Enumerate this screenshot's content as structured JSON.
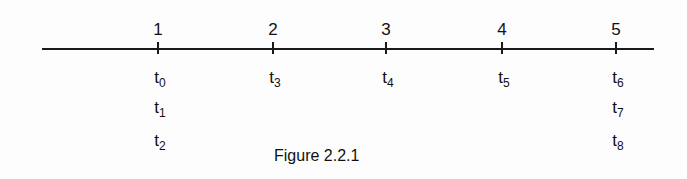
{
  "diagram": {
    "caption": "Figure  2.2.1",
    "points": [
      {
        "label": "1",
        "x": 158,
        "times": [
          "0",
          "1",
          "2"
        ]
      },
      {
        "label": "2",
        "x": 273,
        "times": [
          "3"
        ]
      },
      {
        "label": "3",
        "x": 386,
        "times": [
          "4"
        ]
      },
      {
        "label": "4",
        "x": 502,
        "times": [
          "5"
        ]
      },
      {
        "label": "5",
        "x": 616,
        "times": [
          "6",
          "7",
          "8"
        ]
      }
    ]
  }
}
